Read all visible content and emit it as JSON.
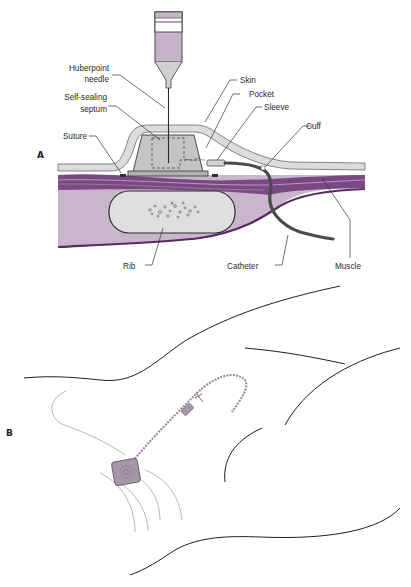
{
  "diagram": {
    "panel_a": {
      "letter": "A",
      "labels": {
        "huberpoint_needle_1": "Huberpoint",
        "huberpoint_needle_2": "needle",
        "septum_1": "Self-sealing",
        "septum_2": "septum",
        "suture": "Suture",
        "skin": "Skin",
        "pocket": "Pocket",
        "sleeve": "Sleeve",
        "cuff": "Cuff",
        "rib": "Rib",
        "catheter": "Catheter",
        "muscle": "Muscle"
      }
    },
    "panel_b": {
      "letter": "B"
    },
    "colors": {
      "skin": "#d9d9dc",
      "port": "#c4c4c6",
      "muscle_dark": "#6e3b74",
      "muscle_light": "#c9b5cc",
      "tissue": "#b9a2bd",
      "rib": "#dedede",
      "syringe_fluid": "#c7b3c9",
      "catheter": "#4a4a4a",
      "device_purple": "#a895ac"
    }
  }
}
